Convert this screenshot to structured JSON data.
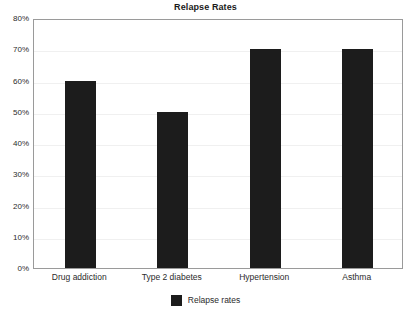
{
  "chart_data": {
    "type": "bar",
    "title": "Relapse Rates",
    "xlabel": "",
    "ylabel": "",
    "categories": [
      "Drug addiction",
      "Type 2 diabetes",
      "Hypertension",
      "Asthma"
    ],
    "series": [
      {
        "name": "Relapse rates",
        "values": [
          60,
          50,
          70,
          70
        ],
        "color": "#1c1c1c"
      }
    ],
    "values": [
      60,
      50,
      70,
      70
    ],
    "ylim": [
      0,
      80
    ],
    "ytick_values": [
      0,
      10,
      20,
      30,
      40,
      50,
      60,
      70,
      80
    ],
    "ytick_labels": [
      "0%",
      "10%",
      "20%",
      "30%",
      "40%",
      "50%",
      "60%",
      "70%",
      "80%"
    ],
    "grid": true,
    "grid_axis": "y",
    "grid_color": "#f0f0f0",
    "legend": {
      "position": "bottom",
      "entries": [
        {
          "label": "Relapse rates",
          "color": "#1c1c1c"
        }
      ]
    },
    "plot_border_color": "#9a9a9a",
    "background_color": "#ffffff"
  },
  "legend_label": "Relapse rates"
}
